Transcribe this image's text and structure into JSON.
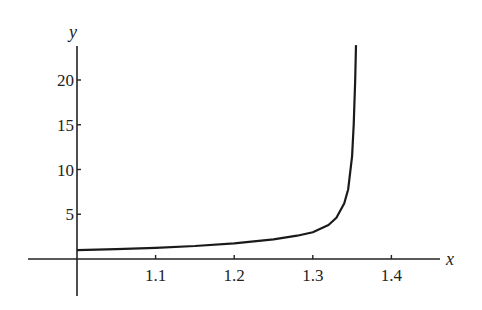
{
  "chart_data": {
    "type": "line",
    "title": "",
    "xlabel": "x",
    "ylabel": "y",
    "xlim": [
      0.99,
      1.46
    ],
    "ylim": [
      -4,
      24
    ],
    "grid": false,
    "legend": null,
    "x_ticks": [
      1.1,
      1.2,
      1.3,
      1.4
    ],
    "x_tick_labels": [
      "1.1",
      "1.2",
      "1.3",
      "1.4"
    ],
    "y_ticks": [
      5,
      10,
      15,
      20
    ],
    "y_tick_labels": [
      "5",
      "10",
      "15",
      "20"
    ],
    "series": [
      {
        "name": "y(x)",
        "x": [
          1.0,
          1.05,
          1.1,
          1.15,
          1.2,
          1.25,
          1.28,
          1.3,
          1.32,
          1.33,
          1.34,
          1.345,
          1.35,
          1.352,
          1.354,
          1.355
        ],
        "y": [
          1.0,
          1.1,
          1.25,
          1.45,
          1.75,
          2.2,
          2.6,
          3.0,
          3.8,
          4.6,
          6.2,
          7.8,
          11.5,
          15,
          20,
          24
        ]
      }
    ],
    "asymptote_x": 1.355
  }
}
